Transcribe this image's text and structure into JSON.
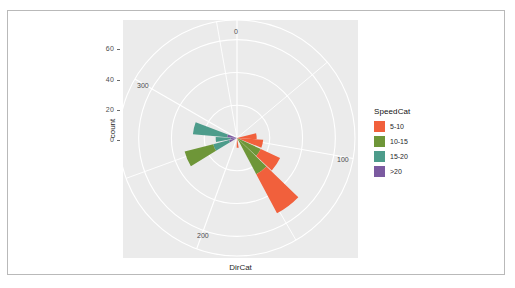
{
  "axes": {
    "ylabel": "count",
    "xlabel": "DirCat",
    "yticks": [
      "0",
      "20",
      "40",
      "60"
    ],
    "ytick_values": [
      0,
      20,
      40,
      60
    ],
    "theta_labels": [
      "0",
      "100",
      "200",
      "300"
    ],
    "theta_values": [
      0,
      100,
      200,
      300
    ]
  },
  "legend": {
    "title": "SpeedCat",
    "items": [
      {
        "label": "5-10",
        "color": "#F1603C"
      },
      {
        "label": "10-15",
        "color": "#6E9638"
      },
      {
        "label": "15-20",
        "color": "#4D9C8B"
      },
      {
        "label": ">20",
        "color": "#7B5AA0"
      }
    ]
  },
  "style": {
    "panel_bg": "#EBEBEB",
    "grid_color": "#FFFFFF",
    "page_bg": "#FFFFFF",
    "frame_border": "#B9B9B9",
    "text_color": "#262626",
    "tick_color": "#4D4D4D"
  },
  "chart_data": {
    "type": "bar",
    "subtype": "polar-stacked-wind-rose",
    "title": "",
    "xlabel": "DirCat",
    "ylabel": "count",
    "theta_unit": "degrees",
    "theta_range": [
      0,
      360
    ],
    "theta_direction": "clockwise",
    "theta_zero_at": "top",
    "rlim": [
      0,
      72
    ],
    "rticks": [
      0,
      20,
      40,
      60
    ],
    "grid": true,
    "legend_position": "right",
    "legend_title": "SpeedCat",
    "categories": [
      0,
      20,
      40,
      60,
      80,
      100,
      120,
      140,
      160,
      180,
      200,
      220,
      240,
      260,
      280,
      300,
      320,
      340
    ],
    "series": [
      {
        "name": "5-10",
        "color": "#F1603C",
        "values": [
          0,
          0,
          0,
          0,
          12,
          16,
          13,
          27,
          0,
          5,
          0,
          0,
          0,
          0,
          0,
          0,
          0,
          0
        ]
      },
      {
        "name": "10-15",
        "color": "#6E9638",
        "values": [
          0,
          0,
          0,
          0,
          0,
          0,
          16,
          25,
          0,
          0,
          0,
          0,
          18,
          0,
          0,
          0,
          0,
          0
        ]
      },
      {
        "name": "15-20",
        "color": "#4D9C8B",
        "values": [
          0,
          0,
          0,
          0,
          0,
          0,
          0,
          0,
          0,
          0,
          0,
          0,
          10,
          0,
          0,
          21,
          0,
          0
        ]
      },
      {
        "name": ">20",
        "color": "#7B5AA0",
        "values": [
          0,
          0,
          0,
          0,
          0,
          0,
          0,
          0,
          0,
          0,
          0,
          0,
          5,
          0,
          0,
          6,
          0,
          0
        ]
      }
    ],
    "bars": [
      {
        "theta_center": 85,
        "theta_width": 18,
        "segments": [
          {
            "cat": "5-10",
            "value": 12
          }
        ]
      },
      {
        "theta_center": 103,
        "theta_width": 18,
        "segments": [
          {
            "cat": "5-10",
            "value": 16
          }
        ]
      },
      {
        "theta_center": 124,
        "theta_width": 18,
        "segments": [
          {
            "cat": "10-15",
            "value": 16
          },
          {
            "cat": "5-10",
            "value": 13
          }
        ]
      },
      {
        "theta_center": 143,
        "theta_width": 18,
        "segments": [
          {
            "cat": "10-15",
            "value": 25
          },
          {
            "cat": "5-10",
            "value": 27
          }
        ]
      },
      {
        "theta_center": 176,
        "theta_width": 12,
        "segments": [
          {
            "cat": "5-10",
            "value": 6
          }
        ]
      },
      {
        "theta_center": 247,
        "theta_width": 17,
        "segments": [
          {
            "cat": ">20",
            "value": 5
          },
          {
            "cat": "15-20",
            "value": 10
          },
          {
            "cat": "10-15",
            "value": 18
          }
        ]
      },
      {
        "theta_center": 266,
        "theta_width": 14,
        "segments": [
          {
            "cat": ">20",
            "value": 4
          },
          {
            "cat": "15-20",
            "value": 9
          }
        ]
      },
      {
        "theta_center": 283,
        "theta_width": 16,
        "segments": [
          {
            "cat": ">20",
            "value": 6
          },
          {
            "cat": "15-20",
            "value": 21
          }
        ]
      }
    ]
  }
}
